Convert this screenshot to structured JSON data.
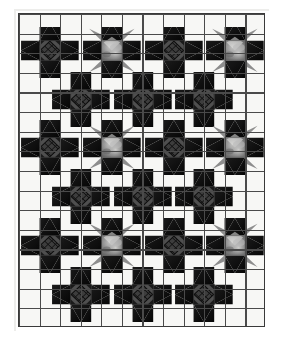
{
  "figure": {
    "kind": "quilt-block-layout-diagram",
    "background_color": "#ffffff",
    "grid": {
      "columns": 12,
      "rows": 16,
      "cell_width": 20.583,
      "cell_height": 19.625,
      "origin_x": 18,
      "origin_y": 13,
      "width": 247,
      "height": 314,
      "cell_fill": "#f7f7f5",
      "line_color": "#4a4a4a",
      "line_width": 1.1,
      "border_color": "#3a3a3a",
      "border_width": 1.4
    },
    "palette": {
      "dark": "#141414",
      "dark_edge": "#0a0a0a",
      "center_dark_square": "#4f4f4f",
      "center_lattice": "#0d0d0d",
      "gray_light": "#b9b9b9",
      "gray_mid": "#8d8d8d",
      "gray_dark": "#5d5d5d",
      "gray_highlight": "#e6e6e4",
      "background": "#f7f7f5"
    },
    "motifs": {
      "types": [
        "dark-star",
        "gray-star"
      ],
      "span_cells": 3,
      "note": "Each motif spans a 3x3 patch area; centers sit on a checkerboard so dark and gray alternate along each row and column.",
      "centers": [
        {
          "col": 2,
          "row": 2,
          "type": "dark-star"
        },
        {
          "col": 5,
          "row": 2,
          "type": "gray-star"
        },
        {
          "col": 8,
          "row": 2,
          "type": "dark-star"
        },
        {
          "col": 11,
          "row": 2,
          "type": "gray-star"
        },
        {
          "col": 14,
          "row": 2,
          "type": "dark-star"
        },
        {
          "col": 3.5,
          "row": 4.5,
          "type": "dark-star"
        },
        {
          "col": 9.5,
          "row": 4.5,
          "type": "dark-star"
        },
        {
          "col": 2,
          "row": 7,
          "type": "dark-star"
        },
        {
          "col": 5,
          "row": 7,
          "type": "gray-star"
        },
        {
          "col": 8,
          "row": 7,
          "type": "dark-star"
        },
        {
          "col": 11,
          "row": 7,
          "type": "gray-star"
        },
        {
          "col": 14,
          "row": 7,
          "type": "dark-star"
        },
        {
          "col": 3.5,
          "row": 9.5,
          "type": "dark-star"
        },
        {
          "col": 9.5,
          "row": 9.5,
          "type": "dark-star"
        },
        {
          "col": 2,
          "row": 12,
          "type": "dark-star"
        },
        {
          "col": 5,
          "row": 12,
          "type": "gray-star"
        },
        {
          "col": 8,
          "row": 12,
          "type": "dark-star"
        },
        {
          "col": 11,
          "row": 12,
          "type": "gray-star"
        },
        {
          "col": 14,
          "row": 12,
          "type": "dark-star"
        },
        {
          "col": 3.5,
          "row": 14.5,
          "type": "dark-star"
        },
        {
          "col": 9.5,
          "row": 14.5,
          "type": "dark-star"
        },
        {
          "col": 2,
          "row": 17,
          "type": "dark-star"
        },
        {
          "col": 5,
          "row": 17,
          "type": "gray-star"
        },
        {
          "col": 8,
          "row": 17,
          "type": "dark-star"
        },
        {
          "col": 11,
          "row": 17,
          "type": "gray-star"
        },
        {
          "col": 14,
          "row": 17,
          "type": "dark-star"
        }
      ]
    },
    "motif_placements": [
      {
        "name": "motif-r1c1",
        "type": "dark",
        "x": 18,
        "y": 19.6,
        "w": 61.75,
        "h": 58.9,
        "clip_top": 6.5
      },
      {
        "name": "motif-r1c2",
        "type": "gray",
        "x": 79.75,
        "y": 19.6,
        "w": 61.75,
        "h": 58.9,
        "clip_top": 6.5
      },
      {
        "name": "motif-r1c3",
        "type": "dark",
        "x": 141.5,
        "y": 19.6,
        "w": 61.75,
        "h": 58.9,
        "clip_top": 6.5
      },
      {
        "name": "motif-r1c4",
        "type": "gray",
        "x": 203.25,
        "y": 19.6,
        "w": 61.75,
        "h": 58.9,
        "clip_top": 6.5
      },
      {
        "name": "motif-r2c1",
        "type": "dark",
        "x": 48.9,
        "y": 68.5,
        "w": 61.75,
        "h": 58.9,
        "clip_top": 0
      },
      {
        "name": "motif-r2c2",
        "type": "dark",
        "x": 110.6,
        "y": 68.5,
        "w": 61.75,
        "h": 58.9,
        "clip_top": 0
      },
      {
        "name": "motif-r2c3",
        "type": "dark",
        "x": 172.4,
        "y": 68.5,
        "w": 61.75,
        "h": 58.9,
        "clip_top": 0
      },
      {
        "name": "motif-r3c1",
        "type": "dark",
        "x": 18,
        "y": 117.4,
        "w": 61.75,
        "h": 58.9,
        "clip_top": 0
      },
      {
        "name": "motif-r3c2",
        "type": "gray",
        "x": 79.75,
        "y": 117.4,
        "w": 61.75,
        "h": 58.9,
        "clip_top": 0
      },
      {
        "name": "motif-r3c3",
        "type": "dark",
        "x": 141.5,
        "y": 117.4,
        "w": 61.75,
        "h": 58.9,
        "clip_top": 0
      },
      {
        "name": "motif-r3c4",
        "type": "gray",
        "x": 203.25,
        "y": 117.4,
        "w": 61.75,
        "h": 58.9,
        "clip_top": 0
      },
      {
        "name": "motif-r4c1",
        "type": "dark",
        "x": 48.9,
        "y": 166.3,
        "w": 61.75,
        "h": 58.9,
        "clip_top": 0
      },
      {
        "name": "motif-r4c2",
        "type": "dark",
        "x": 110.6,
        "y": 166.3,
        "w": 61.75,
        "h": 58.9,
        "clip_top": 0
      },
      {
        "name": "motif-r4c3",
        "type": "dark",
        "x": 172.4,
        "y": 166.3,
        "w": 61.75,
        "h": 58.9,
        "clip_top": 0
      },
      {
        "name": "motif-r5c1",
        "type": "dark",
        "x": 18,
        "y": 215.2,
        "w": 61.75,
        "h": 58.9,
        "clip_top": 0
      },
      {
        "name": "motif-r5c2",
        "type": "gray",
        "x": 79.75,
        "y": 215.2,
        "w": 61.75,
        "h": 58.9,
        "clip_top": 0
      },
      {
        "name": "motif-r5c3",
        "type": "dark",
        "x": 141.5,
        "y": 215.2,
        "w": 61.75,
        "h": 58.9,
        "clip_top": 0
      },
      {
        "name": "motif-r5c4",
        "type": "gray",
        "x": 203.25,
        "y": 215.2,
        "w": 61.75,
        "h": 58.9,
        "clip_top": 0
      },
      {
        "name": "motif-r6c1",
        "type": "dark",
        "x": 48.9,
        "y": 264.1,
        "w": 61.75,
        "h": 58.9,
        "clip_top": 0
      },
      {
        "name": "motif-r6c2",
        "type": "dark",
        "x": 110.6,
        "y": 264.1,
        "w": 61.75,
        "h": 58.9,
        "clip_top": 0
      },
      {
        "name": "motif-r6c3",
        "type": "dark",
        "x": 172.4,
        "y": 264.1,
        "w": 61.75,
        "h": 58.9,
        "clip_top": 0
      }
    ]
  }
}
